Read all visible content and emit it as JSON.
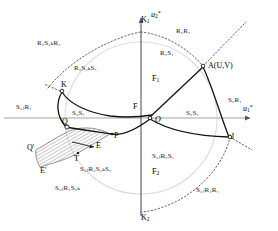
{
  "figure": {
    "colors": {
      "curve": "#141414",
      "axis": "#8a8a8a",
      "dotted": "#4d4d4d",
      "faint_circle": "#d9d9d9",
      "hatch": "#3a3a3a",
      "text": "#1a1a1a",
      "background": "#ffffff"
    },
    "axes": [
      {
        "name": "horizontal-axis",
        "label_base": "u",
        "label_sub": "1",
        "label_sup": "*"
      },
      {
        "name": "vertical-axis",
        "label_base": "u",
        "label_sub": "2",
        "label_sup": "*"
      }
    ],
    "axis_labels": {
      "u1": {
        "base": "u",
        "sub": "1",
        "sup": "*"
      },
      "u2": {
        "base": "u",
        "sub": "2",
        "sup": "*"
      }
    },
    "points": [
      {
        "id": "K1",
        "text": "K",
        "sub": "1",
        "x": 141,
        "y": 16
      },
      {
        "id": "K2",
        "text": "K",
        "sub": "2",
        "x": 141,
        "y": 214
      },
      {
        "id": "F1",
        "text": "F",
        "sub": "1",
        "x": 152,
        "y": 75
      },
      {
        "id": "F2",
        "text": "F",
        "sub": "2",
        "x": 152,
        "y": 168
      },
      {
        "id": "A",
        "text": "A(U,V)",
        "sub": "",
        "x": 213,
        "y": 69
      },
      {
        "id": "K",
        "text": "K",
        "sub": "",
        "x": 61,
        "y": 85
      },
      {
        "id": "F",
        "text": "F",
        "sub": "",
        "x": 134,
        "y": 108
      },
      {
        "id": "O",
        "text": "O",
        "sub": "",
        "x": 155,
        "y": 118
      },
      {
        "id": "J",
        "text": "J",
        "sub": "",
        "x": 226,
        "y": 140
      },
      {
        "id": "Q",
        "text": "Q",
        "sub": "",
        "x": 67,
        "y": 128
      },
      {
        "id": "Qp",
        "text": "Q'",
        "sub": "",
        "x": 30,
        "y": 145
      },
      {
        "id": "P",
        "text": "P",
        "sub": "",
        "x": 114,
        "y": 134
      },
      {
        "id": "E",
        "text": "E",
        "sub": "",
        "x": 97,
        "y": 143
      },
      {
        "id": "Ep",
        "text": "E'",
        "sub": "",
        "x": 44,
        "y": 170
      },
      {
        "id": "T",
        "text": "T",
        "sub": "",
        "x": 76,
        "y": 156
      }
    ],
    "region_labels": [
      {
        "id": "R2S2kR1",
        "text": "R₂S₂ₖR₁",
        "x": 55,
        "y": 43
      },
      {
        "id": "R2S2kS1",
        "text": "R₂S₂ₖS₁",
        "x": 83,
        "y": 68
      },
      {
        "id": "R2R1",
        "text": "R₂R₁",
        "x": 180,
        "y": 30
      },
      {
        "id": "R2S1",
        "text": "R₂S₁",
        "x": 163,
        "y": 52
      },
      {
        "id": "S2R1",
        "text": "S₂R₁",
        "x": 228,
        "y": 100
      },
      {
        "id": "S2S1",
        "text": "S₂S₁",
        "x": 190,
        "y": 113
      },
      {
        "id": "S2jR1",
        "text": "S₂ⱼR₁",
        "x": 24,
        "y": 105
      },
      {
        "id": "S2S1_left",
        "text": "S₂S₁",
        "x": 75,
        "y": 110
      },
      {
        "id": "S2jR2S1",
        "text": "S₂ⱼR₂S₁",
        "x": 158,
        "y": 155
      },
      {
        "id": "S2jR2R1",
        "text": "S₂ⱼR₂R₁",
        "x": 200,
        "y": 190
      },
      {
        "id": "S2jR3S2kS1",
        "text": "S₂ⱼR₃S₂ₖS₁",
        "x": 88,
        "y": 168
      },
      {
        "id": "S2jR1S2k",
        "text": "S₂ⱼR₁S₂ₖ",
        "x": 60,
        "y": 186
      }
    ]
  }
}
